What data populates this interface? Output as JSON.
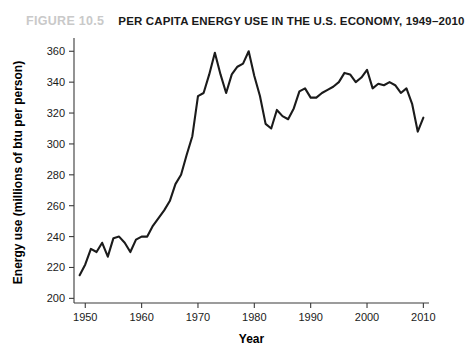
{
  "header": {
    "figure_number": "FIGURE 10.5",
    "title": "PER CAPITA ENERGY USE IN THE U.S. ECONOMY, 1949–2010",
    "figure_number_color": "#c9c9c9",
    "title_color": "#1a1a1a"
  },
  "chart_data": {
    "type": "line",
    "title": "PER CAPITA ENERGY USE IN THE U.S. ECONOMY, 1949–2010",
    "xlabel": "Year",
    "ylabel": "Energy use (millions of btu per person)",
    "xlim": [
      1948,
      2011
    ],
    "ylim": [
      197,
      366
    ],
    "xticks": [
      1950,
      1960,
      1970,
      1980,
      1990,
      2000,
      2010
    ],
    "xticklabels": [
      "1950",
      "1960",
      "1970",
      "1980",
      "1990",
      "2000",
      "2010"
    ],
    "yticks": [
      200,
      220,
      240,
      260,
      280,
      300,
      320,
      340,
      360
    ],
    "yticklabels": [
      "200",
      "220",
      "240",
      "260",
      "280",
      "300",
      "320",
      "340",
      "360"
    ],
    "grid": false,
    "legend": false,
    "line_color": "#1b1b1b",
    "x": [
      1949,
      1950,
      1951,
      1952,
      1953,
      1954,
      1955,
      1956,
      1957,
      1958,
      1959,
      1960,
      1961,
      1962,
      1963,
      1964,
      1965,
      1966,
      1967,
      1968,
      1969,
      1970,
      1971,
      1972,
      1973,
      1974,
      1975,
      1976,
      1977,
      1978,
      1979,
      1980,
      1981,
      1982,
      1983,
      1984,
      1985,
      1986,
      1987,
      1988,
      1989,
      1990,
      1991,
      1992,
      1993,
      1994,
      1995,
      1996,
      1997,
      1998,
      1999,
      2000,
      2001,
      2002,
      2003,
      2004,
      2005,
      2006,
      2007,
      2008,
      2009,
      2010
    ],
    "y": [
      215,
      222,
      232,
      230,
      236,
      227,
      239,
      240,
      236,
      230,
      238,
      240,
      240,
      247,
      252,
      257,
      263,
      274,
      280,
      293,
      305,
      331,
      333,
      345,
      359,
      345,
      333,
      345,
      350,
      352,
      360,
      344,
      331,
      313,
      310,
      322,
      318,
      316,
      323,
      334,
      336,
      330,
      330,
      333,
      335,
      337,
      340,
      346,
      345,
      340,
      343,
      348,
      336,
      339,
      338,
      340,
      338,
      333,
      336,
      326,
      308,
      317
    ],
    "annotations": []
  }
}
